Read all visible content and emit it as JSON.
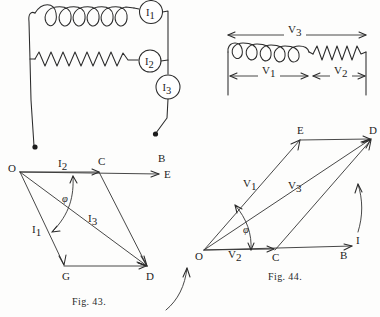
{
  "page": {
    "background_color": "#fdfdfc",
    "ink_color": "#2b2b2b",
    "width": 380,
    "height": 317
  },
  "figures": [
    {
      "id": "circuit-parallel",
      "kind": "circuit-diagram",
      "description": "Inductive coil branch and resistor branch in parallel with three ammeters",
      "meters": [
        {
          "name": "ammeter-i1",
          "label": "I",
          "subscript": "1"
        },
        {
          "name": "ammeter-i2",
          "label": "I",
          "subscript": "2"
        },
        {
          "name": "ammeter-i3",
          "label": "I",
          "subscript": "3"
        }
      ],
      "components": [
        {
          "name": "coil",
          "type": "inductor",
          "turns": 6
        },
        {
          "name": "resistor",
          "type": "zigzag-resistor",
          "teeth": 11
        }
      ],
      "terminals": 2
    },
    {
      "id": "circuit-series",
      "kind": "circuit-diagram",
      "description": "Inductive coil in series with a resistor, showing voltage spans",
      "components": [
        {
          "name": "coil",
          "type": "inductor",
          "turns": 9
        },
        {
          "name": "resistor",
          "type": "zigzag-resistor",
          "teeth": 7
        }
      ],
      "voltage_spans": [
        {
          "name": "v3-span",
          "label": "V",
          "subscript": "3",
          "covers": "whole-circuit",
          "position": "above"
        },
        {
          "name": "v1-span",
          "label": "V",
          "subscript": "1",
          "covers": "coil",
          "position": "below"
        },
        {
          "name": "v2-span",
          "label": "V",
          "subscript": "2",
          "covers": "resistor",
          "position": "below"
        }
      ]
    },
    {
      "id": "fig-43",
      "kind": "phasor-diagram",
      "caption": "Fig. 43.",
      "reference_axis": {
        "name": "e-axis",
        "labels": [
          "B",
          "E"
        ]
      },
      "vertices": [
        {
          "name": "vertex-o",
          "label": "O"
        },
        {
          "name": "vertex-c",
          "label": "C"
        },
        {
          "name": "vertex-g",
          "label": "G"
        },
        {
          "name": "vertex-d",
          "label": "D"
        }
      ],
      "phasors": [
        {
          "name": "phasor-i2",
          "label": "I",
          "subscript": "2",
          "from": "O",
          "to": "C"
        },
        {
          "name": "phasor-i1",
          "label": "I",
          "subscript": "1",
          "from": "O",
          "to": "G"
        },
        {
          "name": "phasor-i3",
          "label": "I",
          "subscript": "3",
          "from": "O",
          "to": "D"
        }
      ],
      "angle": {
        "name": "phase-angle",
        "label": "φ",
        "between": [
          "I2",
          "I1"
        ]
      },
      "rotation_arrow": {
        "name": "rotation-arrow",
        "direction": "counter-clockwise"
      }
    },
    {
      "id": "fig-44",
      "kind": "phasor-diagram",
      "caption": "Fig. 44.",
      "reference_axis": {
        "name": "i-axis",
        "labels": [
          "I",
          "B"
        ]
      },
      "vertices": [
        {
          "name": "vertex-o",
          "label": "O"
        },
        {
          "name": "vertex-c",
          "label": "C"
        },
        {
          "name": "vertex-e",
          "label": "E"
        },
        {
          "name": "vertex-d",
          "label": "D"
        }
      ],
      "phasors": [
        {
          "name": "phasor-v2",
          "label": "V",
          "subscript": "2",
          "from": "O",
          "to": "C"
        },
        {
          "name": "phasor-v1",
          "label": "V",
          "subscript": "1",
          "from": "O",
          "to": "E"
        },
        {
          "name": "phasor-v3",
          "label": "V",
          "subscript": "3",
          "from": "O",
          "to": "D"
        }
      ],
      "angle": {
        "name": "phase-angle",
        "label": "φ",
        "between": [
          "V1",
          "V2"
        ]
      },
      "rotation_arrow": {
        "name": "rotation-arrow",
        "direction": "counter-clockwise"
      }
    }
  ],
  "labels": {
    "i1": "I",
    "i2": "I",
    "i3": "I",
    "v1": "V",
    "v2": "V",
    "v3": "V",
    "sub1": "1",
    "sub2": "2",
    "sub3": "3",
    "O": "O",
    "B": "B",
    "C": "C",
    "D": "D",
    "E": "E",
    "G": "G",
    "I": "I",
    "phi": "φ",
    "caption43": "Fig. 43.",
    "caption44": "Fig. 44."
  }
}
